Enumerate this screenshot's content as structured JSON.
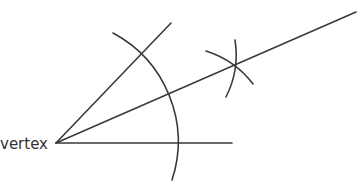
{
  "diagram": {
    "vertex_label": "vertex",
    "stroke_color": "#3a3a3a",
    "points": {
      "vertex": [
        56,
        143
      ],
      "horizontal_ray_end": [
        232,
        143
      ],
      "upper_ray_end": [
        171,
        23
      ],
      "bisector_end": [
        356,
        12
      ],
      "arc_cross_point": [
        235,
        66
      ]
    },
    "arcs": {
      "main_arc": {
        "center": [
          56,
          143
        ],
        "radius": 123,
        "from": [
          113,
          33
        ],
        "to": [
          172,
          180
        ]
      },
      "upper_mark_arc": {
        "center": [
          143,
          52
        ],
        "radius": 93,
        "from": [
          235,
          40
        ],
        "to": [
          226,
          97
        ]
      },
      "lower_mark_arc": {
        "center": [
          179,
          143
        ],
        "radius": 95,
        "from": [
          206,
          51
        ],
        "to": [
          253,
          84
        ]
      }
    }
  }
}
